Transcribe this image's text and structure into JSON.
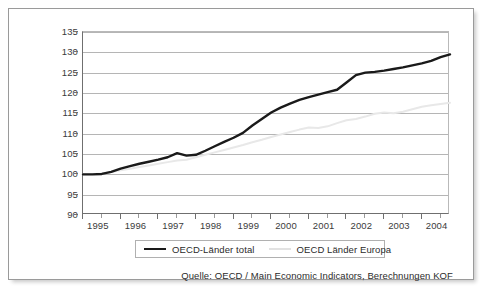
{
  "chart_data": {
    "type": "line",
    "title": "",
    "subtitle": "",
    "xlabel": "",
    "ylabel": "",
    "xlim": [
      1995,
      2004.75
    ],
    "ylim": [
      90,
      135
    ],
    "grid": true,
    "y_ticks": [
      90,
      95,
      100,
      105,
      110,
      115,
      120,
      125,
      130,
      135
    ],
    "x_tick_labels": [
      "1995",
      "1996",
      "1997",
      "1998",
      "1999",
      "2000",
      "2001",
      "2002",
      "2003",
      "2004"
    ],
    "x_tick_values": [
      1995,
      1996,
      1997,
      1998,
      1999,
      2000,
      2001,
      2002,
      2003,
      2004
    ],
    "legend_position": "bottom",
    "x": [
      1995.0,
      1995.25,
      1995.5,
      1995.75,
      1996.0,
      1996.25,
      1996.5,
      1996.75,
      1997.0,
      1997.25,
      1997.5,
      1997.75,
      1998.0,
      1998.25,
      1998.5,
      1998.75,
      1999.0,
      1999.25,
      1999.5,
      1999.75,
      2000.0,
      2000.25,
      2000.5,
      2000.75,
      2001.0,
      2001.25,
      2001.5,
      2001.75,
      2002.0,
      2002.25,
      2002.5,
      2002.75,
      2003.0,
      2003.25,
      2003.5,
      2003.75,
      2004.0,
      2004.25,
      2004.5,
      2004.75
    ],
    "series": [
      {
        "name": "OECD-Länder total",
        "color": "#1a1a1a",
        "width": 2.4,
        "values": [
          100.0,
          100.0,
          100.1,
          100.6,
          101.4,
          102.0,
          102.6,
          103.1,
          103.6,
          104.2,
          105.2,
          104.6,
          104.8,
          105.8,
          106.9,
          108.0,
          109.0,
          110.2,
          112.0,
          113.6,
          115.2,
          116.4,
          117.4,
          118.3,
          119.0,
          119.6,
          120.2,
          120.8,
          122.6,
          124.4,
          125.0,
          125.2,
          125.5,
          125.9,
          126.3,
          126.8,
          127.3,
          127.9,
          128.8,
          129.5
        ]
      },
      {
        "name": "OECD Länder Europa",
        "color": "#e8e8e8",
        "width": 2.0,
        "values": [
          100.0,
          100.0,
          100.2,
          100.6,
          101.0,
          101.4,
          101.8,
          102.2,
          102.6,
          103.0,
          103.4,
          103.6,
          104.2,
          104.8,
          105.4,
          106.0,
          106.6,
          107.2,
          107.9,
          108.5,
          109.2,
          109.8,
          110.4,
          111.0,
          111.5,
          111.4,
          111.8,
          112.6,
          113.3,
          113.6,
          114.2,
          114.9,
          115.2,
          115.0,
          115.4,
          116.0,
          116.6,
          117.0,
          117.3,
          117.6
        ]
      }
    ]
  },
  "legend": {
    "items": [
      {
        "label": "OECD-Länder total",
        "swatch": "black-line-swatch"
      },
      {
        "label": "OECD Länder Europa",
        "swatch": "gray-line-swatch"
      }
    ]
  },
  "source": {
    "text": "Quelle: OECD / Main Economic Indicators, Berechnungen KOF"
  },
  "colors": {
    "series_total": "#1a1a1a",
    "series_europa": "#e8e8e8",
    "gridline": "#b5b5b5",
    "axis": "#6f6f6f",
    "frame_border": "#9a9a9a",
    "text": "#2b2b2b"
  }
}
